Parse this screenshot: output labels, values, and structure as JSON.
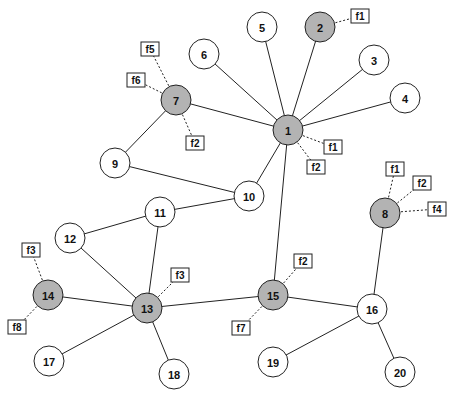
{
  "diagram": {
    "type": "network-graph",
    "colors": {
      "shaded_node": "#b3b3b3",
      "plain_node": "#ffffff",
      "stroke": "#222222"
    },
    "node_radius": 15,
    "nodes": [
      {
        "id": "1",
        "x": 288,
        "y": 130,
        "shaded": true
      },
      {
        "id": "2",
        "x": 320,
        "y": 27,
        "shaded": true
      },
      {
        "id": "3",
        "x": 374,
        "y": 60,
        "shaded": false
      },
      {
        "id": "4",
        "x": 405,
        "y": 98,
        "shaded": false
      },
      {
        "id": "5",
        "x": 262,
        "y": 27,
        "shaded": false
      },
      {
        "id": "6",
        "x": 204,
        "y": 54,
        "shaded": false
      },
      {
        "id": "7",
        "x": 176,
        "y": 100,
        "shaded": true
      },
      {
        "id": "8",
        "x": 385,
        "y": 213,
        "shaded": true
      },
      {
        "id": "9",
        "x": 115,
        "y": 163,
        "shaded": false
      },
      {
        "id": "10",
        "x": 249,
        "y": 196,
        "shaded": false
      },
      {
        "id": "11",
        "x": 160,
        "y": 212,
        "shaded": false
      },
      {
        "id": "12",
        "x": 70,
        "y": 238,
        "shaded": false
      },
      {
        "id": "13",
        "x": 147,
        "y": 308,
        "shaded": true
      },
      {
        "id": "14",
        "x": 48,
        "y": 295,
        "shaded": true
      },
      {
        "id": "15",
        "x": 273,
        "y": 295,
        "shaded": true
      },
      {
        "id": "16",
        "x": 372,
        "y": 309,
        "shaded": false
      },
      {
        "id": "17",
        "x": 49,
        "y": 361,
        "shaded": false
      },
      {
        "id": "18",
        "x": 174,
        "y": 374,
        "shaded": false
      },
      {
        "id": "19",
        "x": 273,
        "y": 362,
        "shaded": false
      },
      {
        "id": "20",
        "x": 400,
        "y": 372,
        "shaded": false
      }
    ],
    "edges": [
      [
        "1",
        "2"
      ],
      [
        "1",
        "3"
      ],
      [
        "1",
        "4"
      ],
      [
        "1",
        "5"
      ],
      [
        "1",
        "6"
      ],
      [
        "1",
        "7"
      ],
      [
        "1",
        "10"
      ],
      [
        "1",
        "15"
      ],
      [
        "7",
        "9"
      ],
      [
        "9",
        "10"
      ],
      [
        "10",
        "11"
      ],
      [
        "11",
        "12"
      ],
      [
        "11",
        "13"
      ],
      [
        "12",
        "13"
      ],
      [
        "13",
        "14"
      ],
      [
        "13",
        "15"
      ],
      [
        "13",
        "17"
      ],
      [
        "13",
        "18"
      ],
      [
        "15",
        "16"
      ],
      [
        "16",
        "8"
      ],
      [
        "16",
        "19"
      ],
      [
        "16",
        "20"
      ]
    ],
    "feature_labels": [
      {
        "node": "2",
        "label": "f1",
        "x": 360,
        "y": 16
      },
      {
        "node": "7",
        "label": "f5",
        "x": 150,
        "y": 49
      },
      {
        "node": "7",
        "label": "f6",
        "x": 136,
        "y": 80
      },
      {
        "node": "7",
        "label": "f2",
        "x": 195,
        "y": 143
      },
      {
        "node": "1",
        "label": "f1",
        "x": 333,
        "y": 147
      },
      {
        "node": "1",
        "label": "f2",
        "x": 316,
        "y": 167
      },
      {
        "node": "8",
        "label": "f1",
        "x": 395,
        "y": 169
      },
      {
        "node": "8",
        "label": "f2",
        "x": 422,
        "y": 183
      },
      {
        "node": "8",
        "label": "f4",
        "x": 437,
        "y": 209
      },
      {
        "node": "14",
        "label": "f3",
        "x": 31,
        "y": 250
      },
      {
        "node": "14",
        "label": "f8",
        "x": 17,
        "y": 327
      },
      {
        "node": "13",
        "label": "f3",
        "x": 180,
        "y": 275
      },
      {
        "node": "15",
        "label": "f2",
        "x": 303,
        "y": 261
      },
      {
        "node": "15",
        "label": "f7",
        "x": 241,
        "y": 328
      }
    ]
  }
}
